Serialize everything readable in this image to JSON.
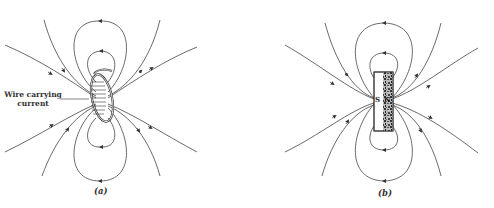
{
  "figure": {
    "panels": [
      {
        "id": "a",
        "caption": "(a)",
        "subject": "current-carrying wire coil",
        "annotation": "Wire carrying current"
      },
      {
        "id": "b",
        "caption": "(b)",
        "subject": "bar magnet",
        "poles": {
          "south": "S",
          "north": "N"
        }
      }
    ],
    "colors": {
      "line": "#444444",
      "background": "#ffffff",
      "magnet_fill": "#555555"
    }
  }
}
